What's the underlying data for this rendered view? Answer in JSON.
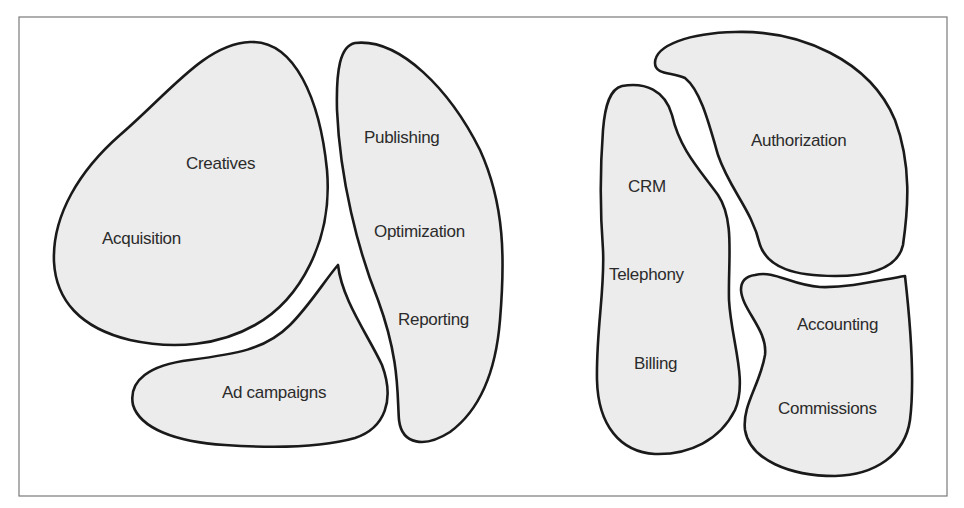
{
  "diagram": {
    "type": "bounded-context blob diagram",
    "groups": [
      {
        "name": "marketing",
        "regions": [
          {
            "id": "acquisition-region",
            "labels": [
              "Creatives",
              "Acquisition"
            ]
          },
          {
            "id": "ad-campaigns-region",
            "labels": [
              "Ad campaigns"
            ]
          },
          {
            "id": "publishing-region",
            "labels": [
              "Publishing",
              "Optimization",
              "Reporting"
            ]
          }
        ]
      },
      {
        "name": "operations",
        "regions": [
          {
            "id": "crm-region",
            "labels": [
              "CRM",
              "Telephony",
              "Billing"
            ]
          },
          {
            "id": "authorization-region",
            "labels": [
              "Authorization"
            ]
          },
          {
            "id": "accounting-region",
            "labels": [
              "Accounting",
              "Commissions"
            ]
          }
        ]
      }
    ],
    "colors": {
      "region_fill": "#ececec",
      "region_stroke": "#1a1a1a",
      "frame_stroke": "#7a7a7a",
      "text": "#2b2b2b"
    }
  }
}
